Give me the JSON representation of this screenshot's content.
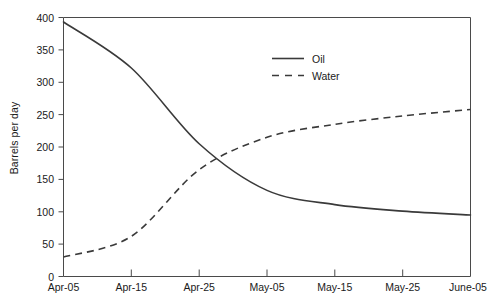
{
  "chart_data": {
    "type": "line",
    "title": "",
    "xlabel": "",
    "ylabel": "Barrels per day",
    "grid": false,
    "legend_position": "upper-center-right",
    "x": [
      "Apr-05",
      "Apr-15",
      "Apr-25",
      "May-05",
      "May-15",
      "May-25",
      "June-05"
    ],
    "xtick_labels": [
      "Apr-05",
      "Apr-15",
      "Apr-25",
      "May-05",
      "May-15",
      "May-25",
      "June-05"
    ],
    "ytick_labels": [
      "0",
      "50",
      "100",
      "150",
      "200",
      "250",
      "300",
      "350",
      "400"
    ],
    "ytick_values": [
      0,
      50,
      100,
      150,
      200,
      250,
      300,
      350,
      400
    ],
    "ylim": [
      0,
      400
    ],
    "series": [
      {
        "name": "Oil",
        "style": "solid",
        "color": "#3a3a3a",
        "values": [
          393,
          322,
          205,
          133,
          111,
          101,
          95
        ]
      },
      {
        "name": "Water",
        "style": "dashed",
        "color": "#3a3a3a",
        "values": [
          30,
          62,
          165,
          215,
          235,
          248,
          258
        ]
      }
    ],
    "legend": [
      {
        "label": "Oil",
        "style": "solid"
      },
      {
        "label": "Water",
        "style": "dashed"
      }
    ]
  },
  "axis": {
    "y_title": "Barrels per day",
    "y_ticks": [
      "400",
      "350",
      "300",
      "250",
      "200",
      "150",
      "100",
      "50",
      "0"
    ],
    "x_ticks": [
      "Apr-05",
      "Apr-15",
      "Apr-25",
      "May-05",
      "May-15",
      "May-25",
      "June-05"
    ]
  },
  "legend": {
    "oil_label": "Oil",
    "water_label": "Water"
  },
  "colors": {
    "line": "#3a3a3a",
    "axis": "#4a4a4a",
    "text": "#1a1a1a",
    "background": "#ffffff"
  }
}
